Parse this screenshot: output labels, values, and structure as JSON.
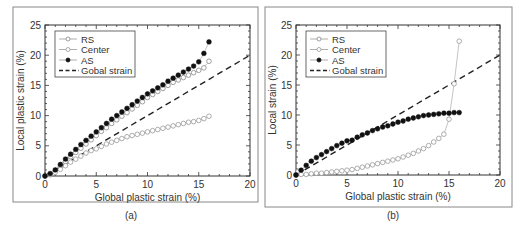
{
  "chart_data": [
    {
      "id": "a",
      "type": "scatter",
      "caption": "(a)",
      "title": "",
      "xlabel": "Global plastic strain (%)",
      "ylabel": "Local plastic strain (%)",
      "xlim": [
        0,
        20
      ],
      "ylim": [
        0,
        25
      ],
      "xticks": [
        0,
        5,
        10,
        15,
        20
      ],
      "yticks": [
        0,
        5,
        10,
        15,
        20,
        25
      ],
      "grid": false,
      "legend_position": "upper-left",
      "legend": [
        "RS",
        "Center",
        "AS",
        "Gobal strain"
      ],
      "series": [
        {
          "name": "RS",
          "marker": "open-circle",
          "color": "#888888",
          "x": [
            0,
            0.5,
            1,
            1.5,
            2,
            2.5,
            3,
            3.5,
            4,
            4.5,
            5,
            5.5,
            6,
            6.5,
            7,
            7.5,
            8,
            8.5,
            9,
            9.5,
            10,
            10.5,
            11,
            11.5,
            12,
            12.5,
            13,
            13.5,
            14,
            14.5,
            15,
            15.5,
            16
          ],
          "y": [
            0,
            0.3,
            0.8,
            1.6,
            2.4,
            3.2,
            3.9,
            4.6,
            5.3,
            6.0,
            6.7,
            7.4,
            8.0,
            8.7,
            9.3,
            9.9,
            10.5,
            11.1,
            11.7,
            12.3,
            13.0,
            13.5,
            14.0,
            14.5,
            15.0,
            15.5,
            15.9,
            16.3,
            16.7,
            17.1,
            17.5,
            17.9,
            19.0
          ]
        },
        {
          "name": "Center",
          "marker": "open-circle",
          "color": "#999999",
          "x": [
            0,
            0.5,
            1,
            1.5,
            2,
            2.5,
            3,
            3.5,
            4,
            4.5,
            5,
            5.5,
            6,
            6.5,
            7,
            7.5,
            8,
            8.5,
            9,
            9.5,
            10,
            10.5,
            11,
            11.5,
            12,
            12.5,
            13,
            13.5,
            14,
            14.5,
            15,
            15.5,
            16
          ],
          "y": [
            0,
            0.2,
            0.6,
            1.1,
            1.7,
            2.3,
            2.8,
            3.3,
            3.8,
            4.2,
            4.5,
            4.9,
            5.3,
            5.6,
            5.9,
            6.2,
            6.5,
            6.7,
            6.9,
            7.1,
            7.3,
            7.5,
            7.7,
            7.9,
            8.1,
            8.3,
            8.5,
            8.7,
            8.9,
            9.0,
            9.2,
            9.5,
            9.9
          ]
        },
        {
          "name": "AS",
          "marker": "filled-circle",
          "color": "#111111",
          "x": [
            0,
            0.5,
            1,
            1.5,
            2,
            2.5,
            3,
            3.5,
            4,
            4.5,
            5,
            5.5,
            6,
            6.5,
            7,
            7.5,
            8,
            8.5,
            9,
            9.5,
            10,
            10.5,
            11,
            11.5,
            12,
            12.5,
            13,
            13.5,
            14,
            14.5,
            15,
            15.5,
            16
          ],
          "y": [
            0,
            0.4,
            1.0,
            1.9,
            2.8,
            3.6,
            4.4,
            5.2,
            5.9,
            6.6,
            7.3,
            8.0,
            8.7,
            9.4,
            10.0,
            10.6,
            11.2,
            11.8,
            12.4,
            13.0,
            13.6,
            14.1,
            14.6,
            15.1,
            15.7,
            16.2,
            16.7,
            17.2,
            17.7,
            18.2,
            18.9,
            20.3,
            22.2
          ]
        },
        {
          "name": "Gobal strain",
          "marker": "dashed-line",
          "color": "#222222",
          "x": [
            0,
            20
          ],
          "y": [
            0,
            20
          ]
        }
      ]
    },
    {
      "id": "b",
      "type": "scatter",
      "caption": "(b)",
      "title": "",
      "xlabel": "Global plastic strain (%)",
      "ylabel": "Local strain (%)",
      "xlim": [
        0,
        20
      ],
      "ylim": [
        0,
        25
      ],
      "xticks": [
        0,
        5,
        10,
        15,
        20
      ],
      "yticks": [
        0,
        5,
        10,
        15,
        20,
        25
      ],
      "grid": false,
      "legend_position": "upper-left",
      "legend": [
        "RS",
        "Center",
        "AS",
        "Gobal strain"
      ],
      "series": [
        {
          "name": "RS",
          "marker": "open-circle",
          "color": "#888888",
          "x": [
            0,
            0.2
          ],
          "y": [
            0,
            0.6
          ]
        },
        {
          "name": "Center",
          "marker": "open-circle",
          "color": "#999999",
          "x": [
            0,
            0.5,
            1,
            1.5,
            2,
            2.5,
            3,
            3.5,
            4,
            4.5,
            5,
            5.5,
            6,
            6.5,
            7,
            7.5,
            8,
            8.5,
            9,
            9.5,
            10,
            10.5,
            11,
            11.5,
            12,
            12.5,
            13,
            13.5,
            14,
            14.5,
            15,
            15.5,
            16
          ],
          "y": [
            0,
            0.1,
            0.1,
            0.2,
            0.3,
            0.3,
            0.4,
            0.5,
            0.6,
            0.7,
            0.8,
            0.9,
            1.1,
            1.3,
            1.5,
            1.7,
            1.9,
            2.1,
            2.3,
            2.5,
            2.7,
            3.0,
            3.3,
            3.6,
            4.0,
            4.4,
            4.9,
            5.5,
            6.1,
            6.8,
            9.3,
            15.2,
            22.3
          ]
        },
        {
          "name": "AS",
          "marker": "filled-circle",
          "color": "#111111",
          "x": [
            0,
            0.5,
            1,
            1.5,
            2,
            2.5,
            3,
            3.5,
            4,
            4.5,
            5,
            5.5,
            6,
            6.5,
            7,
            7.5,
            8,
            8.5,
            9,
            9.5,
            10,
            10.5,
            11,
            11.5,
            12,
            12.5,
            13,
            13.5,
            14,
            14.5,
            15,
            15.5,
            16
          ],
          "y": [
            0,
            0.8,
            1.6,
            2.3,
            2.9,
            3.4,
            3.9,
            4.4,
            4.9,
            5.3,
            5.7,
            5.8,
            6.3,
            6.7,
            7.0,
            7.4,
            7.7,
            8.0,
            8.2,
            8.5,
            8.8,
            9.0,
            9.3,
            9.5,
            9.7,
            9.9,
            10.0,
            10.1,
            10.2,
            10.3,
            10.3,
            10.4,
            10.4
          ]
        },
        {
          "name": "Gobal strain",
          "marker": "dashed-line",
          "color": "#222222",
          "x": [
            0,
            20
          ],
          "y": [
            0,
            20
          ]
        }
      ]
    }
  ]
}
